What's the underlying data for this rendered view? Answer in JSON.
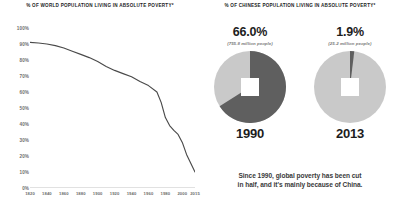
{
  "left": {
    "title": "% OF WORLD POPULATION LIVING IN ABSOLUTE POVERTY*"
  },
  "right": {
    "title": "% OF CHINESE POPULATION LIVING IN ABSOLUTE POVERTY*",
    "donuts": [
      {
        "percent_label": "66.0%",
        "people_label": "(755.8 million people)",
        "year_label": "1990",
        "value": 66.0
      },
      {
        "percent_label": "1.9%",
        "people_label": "(25.2 million people)",
        "year_label": "2013",
        "value": 1.9
      }
    ],
    "caption_line1": "Since 1990, global poverty has been cut",
    "caption_line2": "in half, and it's mainly because of China."
  },
  "colors": {
    "line": "#4a4a4a",
    "axis": "#9a9a9a",
    "tick_text": "#6d6d6d",
    "title_text": "#232323",
    "donut_dark": "#5f5f5f",
    "donut_light": "#c9c9c9",
    "donut_mid": "#a8a8a8",
    "caption_text": "#3a3a3a"
  },
  "chart_data": [
    {
      "type": "line",
      "title": "% OF WORLD POPULATION LIVING IN ABSOLUTE POVERTY*",
      "xlabel": "",
      "ylabel": "",
      "xlim": [
        1820,
        2015
      ],
      "ylim": [
        0,
        100
      ],
      "grid": false,
      "legend": "none",
      "xticks": [
        1820,
        1840,
        1860,
        1880,
        1900,
        1920,
        1940,
        1960,
        1980,
        2000,
        2015
      ],
      "xtick_labels": [
        "1820",
        "1840",
        "1860",
        "1880",
        "1900",
        "1920",
        "1940",
        "1960",
        "1980",
        "2000",
        "2015"
      ],
      "yticks": [
        0,
        10,
        20,
        30,
        40,
        50,
        60,
        70,
        80,
        90,
        100
      ],
      "ytick_labels": [
        "0%",
        "10%",
        "20%",
        "30%",
        "40%",
        "50%",
        "60%",
        "70%",
        "80%",
        "90%",
        "100%"
      ],
      "x": [
        1820,
        1830,
        1840,
        1850,
        1860,
        1870,
        1880,
        1890,
        1900,
        1910,
        1920,
        1930,
        1940,
        1950,
        1960,
        1970,
        1975,
        1980,
        1985,
        1990,
        1995,
        2000,
        2005,
        2010,
        2015
      ],
      "values": [
        91,
        90.6,
        90,
        89,
        87.5,
        85.5,
        83.5,
        81.5,
        79,
        76,
        73.5,
        71.5,
        69.5,
        66.5,
        64,
        60,
        53.5,
        44,
        39,
        36,
        33.5,
        28.5,
        21,
        15.5,
        10
      ]
    },
    {
      "type": "pie",
      "title": "1990",
      "labels": [
        "In absolute poverty",
        "Not in absolute poverty"
      ],
      "values": [
        66.0,
        34.0
      ],
      "annotations": [
        "66.0%",
        "(755.8 million people)"
      ]
    },
    {
      "type": "pie",
      "title": "2013",
      "labels": [
        "In absolute poverty",
        "Not in absolute poverty"
      ],
      "values": [
        1.9,
        98.1
      ],
      "annotations": [
        "1.9%",
        "(25.2 million people)"
      ]
    }
  ]
}
